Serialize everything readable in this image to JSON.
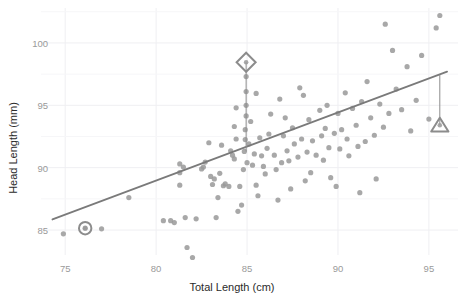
{
  "chart_data": {
    "type": "scatter",
    "title": "",
    "xlabel": "Total Length (cm)",
    "ylabel": "Head Length (mm)",
    "xlim": [
      74.0,
      96.6
    ],
    "ylim": [
      83.0,
      102.8
    ],
    "xticks": [
      75,
      80,
      85,
      90,
      95
    ],
    "yticks": [
      85,
      90,
      95,
      100
    ],
    "xtick_labels": [
      "75",
      "80",
      "85",
      "90",
      "95"
    ],
    "ytick_labels": [
      "85",
      "90",
      "95",
      "100"
    ],
    "grid": true,
    "grid_color": "#efeff2",
    "legend": null,
    "point_color": "#999999",
    "point_size": 4.6,
    "point_opacity": 0.85,
    "regression_line": {
      "color": "#7a7a7a",
      "width": 1.8,
      "x_start": 74.3,
      "y_start": 85.85,
      "x_end": 96.0,
      "y_end": 97.7
    },
    "highlight_color": "#8c8c8c",
    "highlights": [
      {
        "marker": "circle",
        "x": 76.1,
        "y": 85.15,
        "name": "highlight-circle-marker",
        "leader_line": false
      },
      {
        "marker": "diamond",
        "x": 84.95,
        "y": 98.45,
        "name": "highlight-diamond-marker",
        "leader_line": true,
        "leader_to_y": 91.3
      },
      {
        "marker": "triangle",
        "x": 95.6,
        "y": 93.4,
        "name": "highlight-triangle-marker",
        "leader_line": true,
        "leader_to_y": 97.45
      }
    ],
    "points": [
      [
        74.9,
        84.7
      ],
      [
        76.1,
        85.15
      ],
      [
        77.0,
        85.1
      ],
      [
        78.5,
        87.6
      ],
      [
        80.4,
        85.75
      ],
      [
        80.8,
        85.75
      ],
      [
        81.0,
        85.6
      ],
      [
        81.3,
        88.6
      ],
      [
        81.3,
        89.6
      ],
      [
        81.3,
        90.3
      ],
      [
        81.5,
        90.05
      ],
      [
        81.6,
        86.0
      ],
      [
        81.7,
        83.6
      ],
      [
        82.0,
        82.8
      ],
      [
        82.2,
        85.9
      ],
      [
        82.5,
        89.9
      ],
      [
        82.6,
        90.05
      ],
      [
        82.7,
        90.45
      ],
      [
        83.0,
        89.3
      ],
      [
        83.1,
        88.65
      ],
      [
        83.2,
        89.1
      ],
      [
        83.3,
        86.0
      ],
      [
        83.4,
        87.6
      ],
      [
        83.5,
        89.55
      ],
      [
        83.7,
        88.55
      ],
      [
        83.8,
        88.7
      ],
      [
        84.0,
        88.5
      ],
      [
        84.1,
        91.35
      ],
      [
        84.2,
        91.0
      ],
      [
        84.3,
        90.7
      ],
      [
        84.3,
        93.3
      ],
      [
        84.4,
        92.3
      ],
      [
        84.5,
        86.5
      ],
      [
        84.6,
        88.5
      ],
      [
        84.7,
        87.0
      ],
      [
        84.8,
        89.85
      ],
      [
        84.85,
        91.3
      ],
      [
        84.9,
        92.25
      ],
      [
        84.9,
        93.05
      ],
      [
        84.95,
        94.15
      ],
      [
        84.95,
        95.0
      ],
      [
        84.95,
        96.1
      ],
      [
        84.95,
        97.3
      ],
      [
        85.0,
        90.4
      ],
      [
        85.1,
        91.9
      ],
      [
        85.2,
        93.7
      ],
      [
        85.3,
        90.2
      ],
      [
        85.4,
        91.1
      ],
      [
        85.5,
        88.6
      ],
      [
        85.6,
        87.75
      ],
      [
        85.7,
        92.4
      ],
      [
        85.8,
        90.95
      ],
      [
        85.9,
        90.1
      ],
      [
        86.0,
        89.5
      ],
      [
        86.1,
        91.55
      ],
      [
        86.2,
        92.7
      ],
      [
        86.3,
        94.3
      ],
      [
        86.5,
        91.0
      ],
      [
        86.6,
        89.85
      ],
      [
        86.7,
        87.4
      ],
      [
        86.9,
        90.4
      ],
      [
        87.0,
        92.55
      ],
      [
        87.1,
        94.0
      ],
      [
        87.2,
        91.35
      ],
      [
        87.3,
        90.55
      ],
      [
        87.4,
        88.3
      ],
      [
        87.5,
        93.2
      ],
      [
        87.6,
        91.9
      ],
      [
        87.8,
        90.85
      ],
      [
        88.0,
        92.3
      ],
      [
        88.1,
        95.8
      ],
      [
        88.2,
        88.95
      ],
      [
        88.3,
        91.25
      ],
      [
        88.4,
        93.85
      ],
      [
        88.6,
        92.15
      ],
      [
        88.8,
        91.0
      ],
      [
        89.0,
        94.6
      ],
      [
        89.1,
        92.55
      ],
      [
        89.2,
        90.6
      ],
      [
        89.3,
        93.15
      ],
      [
        89.4,
        95.0
      ],
      [
        89.5,
        91.6
      ],
      [
        89.6,
        89.2
      ],
      [
        89.8,
        92.75
      ],
      [
        90.0,
        94.35
      ],
      [
        90.1,
        91.5
      ],
      [
        90.2,
        93.05
      ],
      [
        90.4,
        96.0
      ],
      [
        90.5,
        92.3
      ],
      [
        90.6,
        90.95
      ],
      [
        90.8,
        94.75
      ],
      [
        91.0,
        93.4
      ],
      [
        91.1,
        91.7
      ],
      [
        91.3,
        95.3
      ],
      [
        91.5,
        92.1
      ],
      [
        91.6,
        96.9
      ],
      [
        91.8,
        94.0
      ],
      [
        92.0,
        92.6
      ],
      [
        92.1,
        89.1
      ],
      [
        92.3,
        95.1
      ],
      [
        92.5,
        93.25
      ],
      [
        92.6,
        101.5
      ],
      [
        92.8,
        94.35
      ],
      [
        93.0,
        99.4
      ],
      [
        93.2,
        96.3
      ],
      [
        93.5,
        94.65
      ],
      [
        93.8,
        98.1
      ],
      [
        94.0,
        92.95
      ],
      [
        94.3,
        95.4
      ],
      [
        94.6,
        99.0
      ],
      [
        95.0,
        93.9
      ],
      [
        95.4,
        101.2
      ],
      [
        95.6,
        102.2
      ],
      [
        82.9,
        92.0
      ],
      [
        83.6,
        91.8
      ],
      [
        84.4,
        94.8
      ],
      [
        86.8,
        95.5
      ],
      [
        88.5,
        89.6
      ],
      [
        89.9,
        88.5
      ],
      [
        91.2,
        88.0
      ],
      [
        85.5,
        95.95
      ],
      [
        87.9,
        96.4
      ]
    ]
  }
}
